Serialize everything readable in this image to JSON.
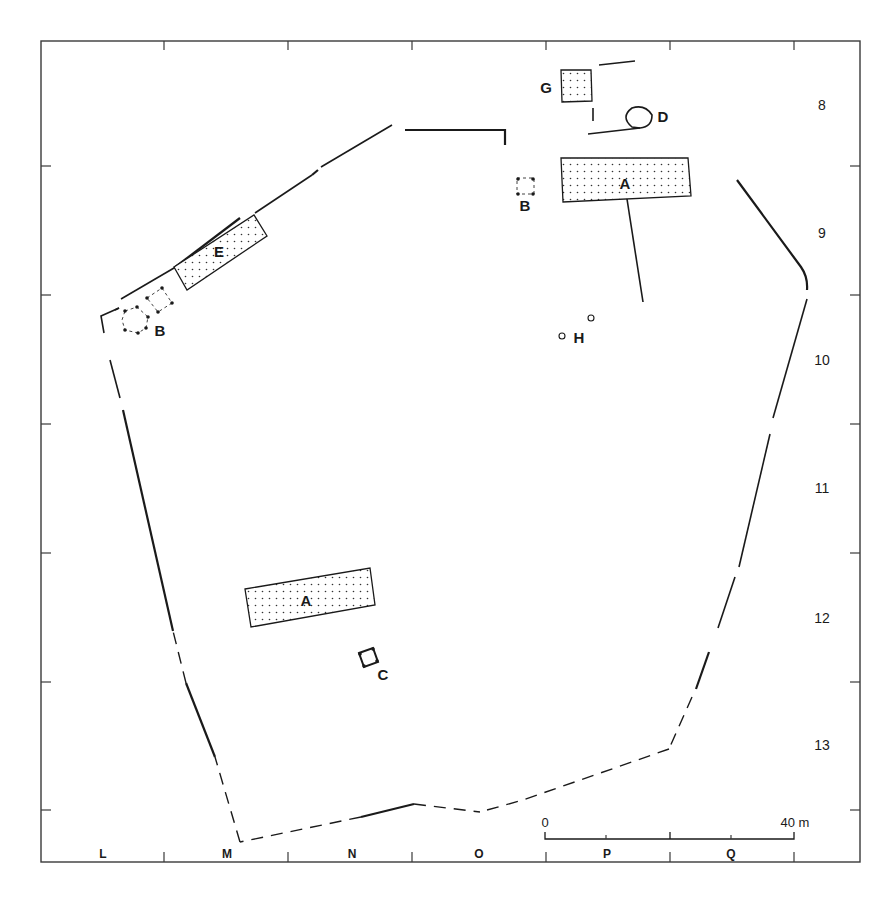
{
  "map": {
    "type": "archaeological-site-plan",
    "frame": {
      "x1": 41,
      "y1": 41,
      "x2": 860,
      "y2": 862
    },
    "grid": {
      "columns": [
        {
          "label": "L",
          "x": 103
        },
        {
          "label": "M",
          "x": 227
        },
        {
          "label": "N",
          "x": 352
        },
        {
          "label": "O",
          "x": 479
        },
        {
          "label": "P",
          "x": 607
        },
        {
          "label": "Q",
          "x": 731
        }
      ],
      "column_ticks_x": [
        164,
        288,
        412,
        546,
        670,
        794
      ],
      "rows": [
        {
          "label": "8",
          "y": 105
        },
        {
          "label": "9",
          "y": 233
        },
        {
          "label": "10",
          "y": 360
        },
        {
          "label": "11",
          "y": 488
        },
        {
          "label": "12",
          "y": 618
        },
        {
          "label": "13",
          "y": 745
        }
      ],
      "row_ticks_y": [
        166,
        295,
        424,
        553,
        682,
        810
      ]
    },
    "scale_bar": {
      "start_label": "0",
      "end_label": "40 m",
      "length_m": 40,
      "x1": 545,
      "x2": 794,
      "y": 839
    },
    "features": [
      {
        "id": "A",
        "label": "A",
        "kind": "building",
        "position": "north-east",
        "label_x": 625,
        "label_y": 189
      },
      {
        "id": "A2",
        "label": "A",
        "kind": "building",
        "position": "south-west",
        "label_x": 306,
        "label_y": 606
      },
      {
        "id": "B1",
        "label": "B",
        "kind": "post-structure",
        "position": "north",
        "label_x": 525,
        "label_y": 211
      },
      {
        "id": "B2",
        "label": "B",
        "kind": "post-structure",
        "position": "west",
        "label_x": 160,
        "label_y": 336
      },
      {
        "id": "C",
        "label": "C",
        "kind": "post-structure",
        "position": "south",
        "label_x": 383,
        "label_y": 680
      },
      {
        "id": "D",
        "label": "D",
        "kind": "round-feature",
        "position": "north",
        "label_x": 663,
        "label_y": 122
      },
      {
        "id": "E",
        "label": "E",
        "kind": "building",
        "position": "north-west",
        "label_x": 219,
        "label_y": 257
      },
      {
        "id": "G",
        "label": "G",
        "kind": "building",
        "position": "north",
        "label_x": 546,
        "label_y": 93
      },
      {
        "id": "H",
        "label": "H",
        "kind": "pits",
        "position": "centre",
        "label_x": 579,
        "label_y": 343
      }
    ]
  }
}
